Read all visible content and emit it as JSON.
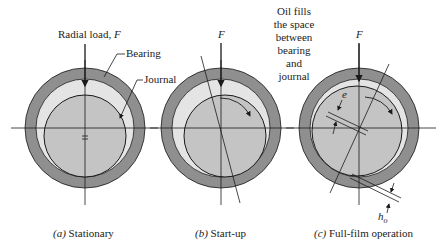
{
  "diagram": {
    "colors": {
      "bearing": "#8f8f8f",
      "oil": "#e4e4e4",
      "journal": "#c4c4c4",
      "line": "#1a1a1a",
      "text": "#222222"
    },
    "panels": [
      {
        "id": "a",
        "caption_letter": "(a)",
        "caption_text": " Stationary",
        "labels": {
          "load": "Radial load, ",
          "load_symbol": "F",
          "bearing": "Bearing",
          "journal": "Journal"
        }
      },
      {
        "id": "b",
        "caption_letter": "(b)",
        "caption_text": " Start-up",
        "labels": {
          "load_symbol": "F"
        }
      },
      {
        "id": "c",
        "caption_letter": "(c)",
        "caption_text": " Full-film operation",
        "labels": {
          "load_symbol": "F",
          "eccentricity": "e",
          "min_film": "h",
          "min_film_sub": "o",
          "oil_note": [
            "Oil fills",
            "the space",
            "between",
            "bearing",
            "and",
            "journal"
          ]
        }
      }
    ]
  }
}
